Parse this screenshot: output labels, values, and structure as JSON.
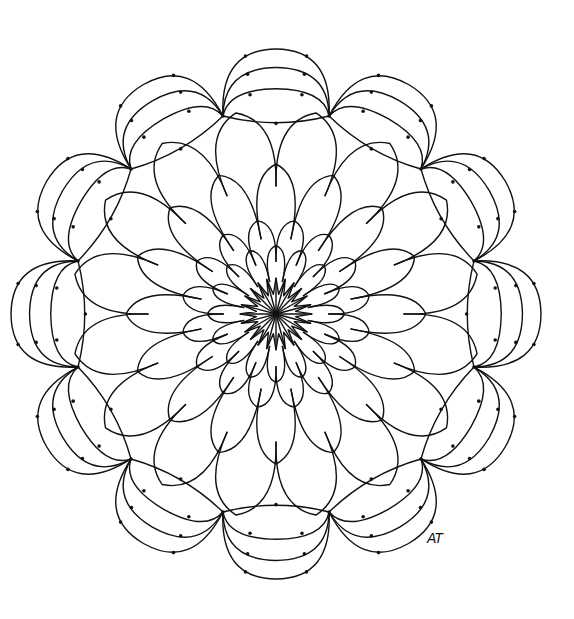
{
  "artwork": {
    "type": "mandala line drawing",
    "center": [
      276,
      314
    ],
    "stroke_color": "#111111",
    "background": "#ffffff",
    "layers": {
      "core_star_points": 24,
      "inner_petals": 16,
      "middle_petals": 16,
      "outer_petals": 16,
      "rim_lobes": 12
    },
    "radii": {
      "core": 36,
      "inner": 95,
      "middle": 150,
      "outer": 205,
      "rim": 265
    }
  },
  "signature": "AT"
}
